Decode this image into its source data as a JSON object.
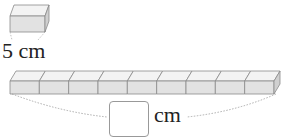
{
  "single_block": {
    "length_value": "5",
    "unit": "cm",
    "label": "5 cm"
  },
  "row": {
    "block_count": 9
  },
  "answer": {
    "value": "",
    "unit": "cm"
  },
  "colors": {
    "block_front": "#e2e2e2",
    "block_top": "#f3f3f3",
    "edge": "#8a8a8a",
    "dotted": "#999999"
  }
}
